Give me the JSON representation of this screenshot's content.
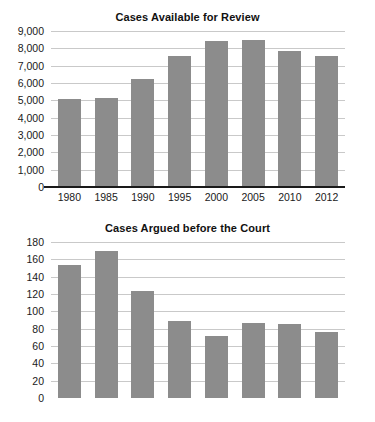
{
  "figure": {
    "background_color": "#ffffff",
    "bar_color": "#8c8c8c",
    "gridline_color": "#c9c9c9",
    "axis_color": "#1a1a1a",
    "text_color": "#111111"
  },
  "chart_data": [
    {
      "id": "cases-available",
      "type": "bar",
      "title": "Cases Available for Review",
      "xlabel": "",
      "ylabel": "",
      "categories": [
        "1980",
        "1985",
        "1990",
        "1995",
        "2000",
        "2005",
        "2010",
        "2012"
      ],
      "values": [
        5100,
        5110,
        6250,
        7550,
        8450,
        8500,
        7850,
        7530
      ],
      "ylim": [
        0,
        9000
      ],
      "yticks": [
        0,
        1000,
        2000,
        3000,
        4000,
        5000,
        6000,
        7000,
        8000,
        9000
      ],
      "ytick_labels": [
        "0",
        "1,000",
        "2,000",
        "3,000",
        "4,000",
        "5,000",
        "6,000",
        "7,000",
        "8,000",
        "9,000"
      ],
      "grid": true,
      "legend": null
    },
    {
      "id": "cases-argued",
      "type": "bar",
      "title": "Cases Argued before the Court",
      "xlabel": "",
      "ylabel": "",
      "categories": [
        "1980",
        "1985",
        "1990",
        "1995",
        "2000",
        "2005",
        "2010",
        "2012"
      ],
      "values": [
        154,
        170,
        124,
        89,
        71,
        86,
        85,
        76
      ],
      "ylim": [
        0,
        180
      ],
      "yticks": [
        0,
        20,
        40,
        60,
        80,
        100,
        120,
        140,
        160,
        180
      ],
      "ytick_labels": [
        "0",
        "20",
        "40",
        "60",
        "80",
        "100",
        "120",
        "140",
        "160",
        "180"
      ],
      "grid": true,
      "legend": null
    }
  ]
}
